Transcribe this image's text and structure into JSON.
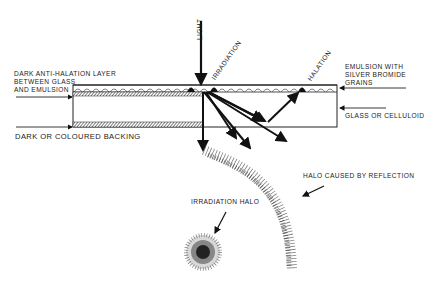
{
  "diagram": {
    "labels": {
      "light": "LIGHT",
      "irradiation": "IRRADIATION",
      "halation": "HALATION",
      "anti_halation_line1": "DARK ANTI-HALATION LAYER",
      "anti_halation_line2": "BETWEEN GLASS",
      "anti_halation_line3": "AND EMULSION",
      "emulsion_line1": "EMULSION WITH",
      "emulsion_line2": "SILVER BROMIDE",
      "emulsion_line3": "GRAINS",
      "glass": "GLASS OR CELLULOID",
      "backing": "DARK OR COLOURED BACKING",
      "halo_reflection": "HALO CAUSED BY REFLECTION",
      "irradiation_halo": "IRRADIATION HALO"
    },
    "colors": {
      "ink": "#1a1a1a",
      "background": "#ffffff"
    }
  }
}
